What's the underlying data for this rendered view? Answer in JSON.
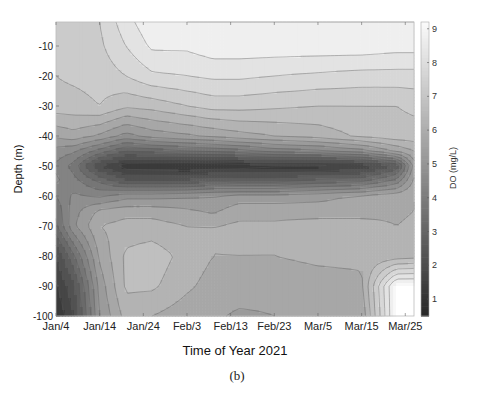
{
  "chart_data": {
    "type": "heatmap",
    "subtype": "filled-contour",
    "title": "",
    "caption": "(b)",
    "xlabel": "Time of Year 2021",
    "ylabel": "Depth (m)",
    "colorbar_label": "DO (mg/L)",
    "x_tick_labels": [
      "Jan/4",
      "Jan/14",
      "Jan/24",
      "Feb/3",
      "Feb/13",
      "Feb/23",
      "Mar/5",
      "Mar/15",
      "Mar/25"
    ],
    "x_tick_days": [
      0,
      10,
      20,
      30,
      40,
      50,
      60,
      70,
      80
    ],
    "xlim_days": [
      0,
      82
    ],
    "y_ticks": [
      -10,
      -20,
      -30,
      -40,
      -50,
      -60,
      -70,
      -80,
      -90,
      -100
    ],
    "ylim": [
      -100,
      -2
    ],
    "colorbar_ticks": [
      1,
      2,
      3,
      4,
      5,
      6,
      7,
      8,
      9
    ],
    "clim": [
      0.5,
      9.2
    ],
    "colormap": "gray",
    "legend": "colorbar-right",
    "grid": false,
    "x_days": [
      0,
      4,
      10,
      16,
      22,
      30,
      36,
      42,
      50,
      60,
      70,
      78,
      82
    ],
    "depths": [
      -2,
      -10,
      -20,
      -30,
      -40,
      -45,
      -50,
      -55,
      -60,
      -65,
      -70,
      -80,
      -90,
      -100
    ],
    "do_mg_per_L": [
      [
        7.2,
        7.3,
        7.5,
        8.3,
        8.9,
        9.0,
        9.0,
        9.0,
        9.0,
        9.0,
        9.0,
        9.0,
        9.0
      ],
      [
        7.1,
        7.2,
        7.4,
        8.0,
        8.6,
        8.6,
        8.8,
        8.8,
        8.8,
        8.8,
        8.8,
        8.7,
        8.7
      ],
      [
        7.0,
        7.1,
        7.2,
        7.5,
        7.9,
        8.0,
        8.1,
        8.1,
        8.0,
        7.9,
        7.8,
        7.8,
        7.8
      ],
      [
        6.8,
        6.8,
        7.0,
        6.6,
        6.7,
        7.0,
        7.2,
        7.2,
        7.1,
        7.0,
        7.0,
        7.0,
        7.1
      ],
      [
        5.6,
        5.8,
        5.4,
        4.8,
        5.2,
        5.4,
        5.6,
        5.8,
        6.0,
        6.2,
        6.6,
        6.8,
        6.8
      ],
      [
        4.8,
        4.6,
        3.8,
        3.0,
        3.2,
        3.5,
        3.6,
        3.8,
        4.2,
        4.4,
        4.8,
        5.6,
        6.0
      ],
      [
        4.4,
        3.8,
        2.0,
        1.2,
        1.1,
        1.0,
        1.1,
        1.2,
        1.3,
        1.3,
        1.6,
        2.6,
        5.2
      ],
      [
        4.6,
        4.2,
        3.4,
        2.6,
        2.6,
        2.6,
        3.0,
        2.8,
        2.8,
        3.2,
        3.4,
        4.2,
        5.6
      ],
      [
        4.0,
        4.6,
        4.4,
        4.8,
        4.8,
        4.9,
        5.0,
        5.2,
        5.2,
        5.3,
        5.6,
        5.8,
        6.0
      ],
      [
        3.6,
        4.8,
        5.6,
        5.8,
        5.8,
        5.6,
        5.4,
        5.8,
        5.8,
        5.8,
        5.8,
        5.9,
        6.0
      ],
      [
        3.4,
        4.9,
        6.0,
        6.2,
        6.2,
        6.0,
        6.0,
        6.1,
        6.1,
        6.2,
        6.2,
        6.0,
        6.1
      ],
      [
        2.0,
        3.4,
        5.6,
        6.6,
        6.8,
        6.3,
        6.0,
        6.0,
        6.0,
        6.1,
        6.1,
        6.2,
        6.3
      ],
      [
        1.4,
        2.4,
        5.2,
        6.6,
        6.6,
        6.1,
        5.8,
        5.8,
        5.7,
        5.8,
        5.9,
        9.2,
        9.2
      ],
      [
        1.0,
        2.0,
        5.0,
        6.2,
        6.0,
        5.7,
        5.6,
        5.4,
        5.5,
        5.6,
        5.6,
        9.2,
        9.2
      ]
    ],
    "contour_levels": [
      1,
      1.5,
      2,
      2.5,
      3,
      3.5,
      4,
      4.5,
      5,
      5.5,
      6,
      6.5,
      7,
      7.5,
      8,
      8.5,
      9
    ],
    "note": "Values estimated from grayscale shading; white region at bottom-right (Mar/12–Mar/25, below -90 m) indicates no data."
  }
}
